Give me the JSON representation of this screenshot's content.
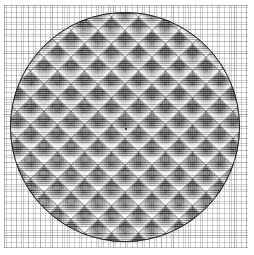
{
  "figure": {
    "width_px": 254,
    "height_px": 255,
    "background_color": "#ffffff"
  },
  "chart_data": {
    "type": "heatmap",
    "title": "",
    "subtitle": "",
    "xlabel": "",
    "ylabel": "",
    "description": "Dense square grid field clipped to a circular disc, producing a moire diamond lattice of alternating light and dark cells.",
    "grid": true,
    "legend": "none",
    "xlim": [
      -1,
      1
    ],
    "ylim": [
      -1,
      1
    ],
    "xticks": [],
    "yticks": [],
    "shape": {
      "kind": "circle",
      "center_x_px": 125,
      "center_y_px": 127,
      "radius_px": 115,
      "outline_color": "#1d1d1d",
      "outline_width_px": 1,
      "fill_color": "#9a9a9a"
    },
    "background_grid": {
      "minor_spacing_px": 2.42,
      "major_spacing_px": 12.1,
      "minor_color": "#8c8c8c",
      "major_color": "#787878",
      "left_px": 4,
      "top_px": 5,
      "width_px": 244,
      "height_px": 243
    },
    "mesh": {
      "row_spacing_px": 2.15,
      "column_spacing_px": 2.15,
      "row_color": "#1e1e1e",
      "column_color": "#282828"
    },
    "moire": {
      "lattice_period_px": 19.1,
      "diagonal_angles_deg": [
        45,
        -45
      ],
      "highlight_color": "#ffffff",
      "node_color": "#141414"
    },
    "center_marker": {
      "x_px": 125,
      "y_px": 128,
      "color": "#101010",
      "size_px": 2
    },
    "palette": {
      "lightest": "#ffffff",
      "light": "#d8d8d8",
      "mid": "#9a9a9a",
      "dark": "#4a4a4a",
      "darkest": "#1d1d1d"
    }
  }
}
